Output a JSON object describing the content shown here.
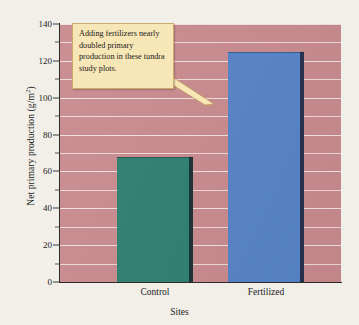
{
  "chart_data": {
    "type": "bar",
    "title": "",
    "subtitle": "",
    "xlabel": "Sites",
    "ylabel": "Net primary production (g/m",
    "ylabel_superscript": "2",
    "ylabel_suffix": ")",
    "ylabel_full": "Net primary production (g/m2)",
    "categories": [
      "Control",
      "Fertilized"
    ],
    "values": [
      68,
      125
    ],
    "series": [
      {
        "name": "Net primary production",
        "values": [
          68,
          125
        ]
      }
    ],
    "ylim": [
      0,
      140
    ],
    "ytick_labels": [
      "0",
      "20",
      "40",
      "60",
      "80",
      "100",
      "120",
      "140"
    ],
    "ytick_values": [
      0,
      20,
      40,
      60,
      80,
      100,
      120,
      140
    ],
    "yminor_values": [
      10,
      30,
      50,
      70,
      90,
      110,
      130
    ],
    "grid": true,
    "grid_axis": "y",
    "legend": false,
    "legend_position": "none",
    "annotations": [
      {
        "text": "Adding fertilizers nearly doubled primary production in these tundra study plots.",
        "points_to": "Fertilized",
        "style": "callout-box"
      }
    ],
    "bar_colors": [
      "#2e8071",
      "#5684c8"
    ],
    "plot_background": "#c98b8e",
    "gridline_color": "#f2dede",
    "callout_background": "#f7e6b6",
    "callout_border": "#caa96a",
    "axis_color": "#2b2b2b",
    "page_background": "#f2efe9"
  },
  "axes": {
    "y_label_text": "Net primary production (g/m",
    "y_label_sup": "2",
    "y_label_close": ")",
    "x_label_text": "Sites"
  },
  "annotation": {
    "line1": "Adding fertilizers",
    "line2": "nearly doubled",
    "line3": "primary production in",
    "line4": "these tundra study",
    "line5": "plots."
  }
}
